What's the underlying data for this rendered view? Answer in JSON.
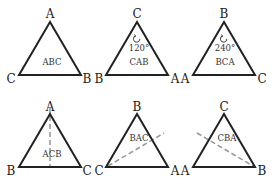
{
  "diagram": {
    "triangles": [
      {
        "id": "identity",
        "label": "ABC",
        "vertices": {
          "top": "A",
          "left": "C",
          "right": "B"
        },
        "rotation": null,
        "reflection_axis": null
      },
      {
        "id": "rotation-120",
        "label": "CAB",
        "vertices": {
          "top": "C",
          "left": "B",
          "right": "A"
        },
        "rotation": "120°",
        "reflection_axis": null
      },
      {
        "id": "rotation-240",
        "label": "BCA",
        "vertices": {
          "top": "B",
          "left": "A",
          "right": "C"
        },
        "rotation": "240°",
        "reflection_axis": null
      },
      {
        "id": "reflection-vertical",
        "label": "ACB",
        "vertices": {
          "top": "A",
          "left": "B",
          "right": "C"
        },
        "rotation": null,
        "reflection_axis": "through top vertex (vertical)"
      },
      {
        "id": "reflection-left",
        "label": "BAC",
        "vertices": {
          "top": "B",
          "left": "C",
          "right": "A"
        },
        "rotation": null,
        "reflection_axis": "through bottom-left vertex"
      },
      {
        "id": "reflection-right",
        "label": "CBA",
        "vertices": {
          "top": "C",
          "left": "A",
          "right": "B"
        },
        "rotation": null,
        "reflection_axis": "through bottom-right vertex"
      }
    ]
  },
  "colors": {
    "edge": "#222222",
    "axis": "#9a9a9a",
    "background": "#ffffff"
  }
}
